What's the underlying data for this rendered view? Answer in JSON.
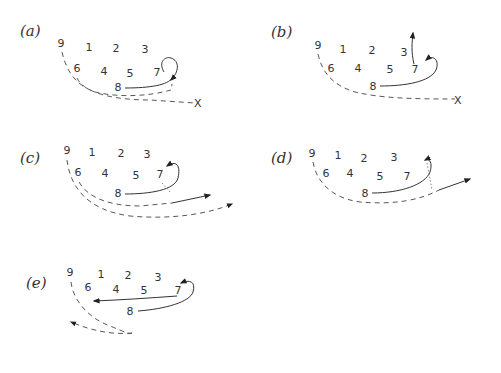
{
  "figure": {
    "type": "football-play-diagrams",
    "panels": [
      {
        "id": "a",
        "label": "(a)",
        "players": [
          {
            "n": "9",
            "x": 61,
            "y": 47
          },
          {
            "n": "1",
            "x": 89,
            "y": 51
          },
          {
            "n": "2",
            "x": 116,
            "y": 52
          },
          {
            "n": "3",
            "x": 145,
            "y": 53
          },
          {
            "n": "6",
            "x": 77,
            "y": 72
          },
          {
            "n": "4",
            "x": 104,
            "y": 75
          },
          {
            "n": "5",
            "x": 130,
            "y": 77
          },
          {
            "n": "7",
            "x": 157,
            "y": 76
          },
          {
            "n": "8",
            "x": 118,
            "y": 91
          }
        ],
        "end_marker": "X"
      },
      {
        "id": "b",
        "label": "(b)",
        "players": [
          {
            "n": "9",
            "x": 318,
            "y": 49
          },
          {
            "n": "1",
            "x": 343,
            "y": 53
          },
          {
            "n": "2",
            "x": 372,
            "y": 54
          },
          {
            "n": "3",
            "x": 404,
            "y": 56
          },
          {
            "n": "6",
            "x": 331,
            "y": 72
          },
          {
            "n": "4",
            "x": 358,
            "y": 72
          },
          {
            "n": "5",
            "x": 390,
            "y": 73
          },
          {
            "n": "7",
            "x": 415,
            "y": 73
          },
          {
            "n": "8",
            "x": 373,
            "y": 90
          }
        ],
        "end_marker": "X"
      },
      {
        "id": "c",
        "label": "(c)",
        "players": [
          {
            "n": "9",
            "x": 67,
            "y": 154
          },
          {
            "n": "1",
            "x": 92,
            "y": 156
          },
          {
            "n": "2",
            "x": 121,
            "y": 157
          },
          {
            "n": "3",
            "x": 147,
            "y": 158
          },
          {
            "n": "6",
            "x": 78,
            "y": 176
          },
          {
            "n": "4",
            "x": 105,
            "y": 177
          },
          {
            "n": "5",
            "x": 136,
            "y": 179
          },
          {
            "n": "7",
            "x": 160,
            "y": 178
          },
          {
            "n": "8",
            "x": 118,
            "y": 197
          }
        ]
      },
      {
        "id": "d",
        "label": "(d)",
        "players": [
          {
            "n": "9",
            "x": 312,
            "y": 157
          },
          {
            "n": "1",
            "x": 338,
            "y": 159
          },
          {
            "n": "2",
            "x": 364,
            "y": 162
          },
          {
            "n": "3",
            "x": 394,
            "y": 161
          },
          {
            "n": "6",
            "x": 326,
            "y": 177
          },
          {
            "n": "4",
            "x": 350,
            "y": 177
          },
          {
            "n": "5",
            "x": 380,
            "y": 180
          },
          {
            "n": "7",
            "x": 407,
            "y": 180
          },
          {
            "n": "8",
            "x": 365,
            "y": 197
          }
        ]
      },
      {
        "id": "e",
        "label": "(e)",
        "players": [
          {
            "n": "9",
            "x": 70,
            "y": 276
          },
          {
            "n": "1",
            "x": 101,
            "y": 278
          },
          {
            "n": "2",
            "x": 128,
            "y": 279
          },
          {
            "n": "3",
            "x": 158,
            "y": 281
          },
          {
            "n": "6",
            "x": 88,
            "y": 291
          },
          {
            "n": "4",
            "x": 116,
            "y": 293
          },
          {
            "n": "5",
            "x": 144,
            "y": 294
          },
          {
            "n": "7",
            "x": 178,
            "y": 294
          },
          {
            "n": "8",
            "x": 130,
            "y": 315
          }
        ]
      }
    ]
  }
}
